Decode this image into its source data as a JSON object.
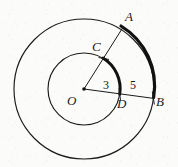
{
  "figure": {
    "background_color": "#fbfbfa",
    "stroke_color": "#1a1a1a",
    "center": {
      "label": "O",
      "x": 84,
      "y": 89
    },
    "circles": [
      {
        "name": "outer-circle",
        "radius": 70,
        "thin_stroke": 1.1
      },
      {
        "name": "inner-circle",
        "radius": 36,
        "thin_stroke": 1.1
      }
    ],
    "points": {
      "A": {
        "label": "A",
        "x": 123,
        "y": 27,
        "on": "outer-circle"
      },
      "B": {
        "label": "B",
        "x": 153,
        "y": 98,
        "on": "outer-circle"
      },
      "C": {
        "label": "C",
        "x": 104,
        "y": 57,
        "on": "inner-circle"
      },
      "D": {
        "label": "D",
        "x": 120,
        "y": 94,
        "on": "inner-circle"
      },
      "O": {
        "label": "O",
        "x": 84,
        "y": 89,
        "on": "center"
      }
    },
    "radii_segments": [
      {
        "name": "segment-OA",
        "from": "O",
        "to": "A",
        "measure_label": "3",
        "through": "C"
      },
      {
        "name": "segment-OB",
        "from": "O",
        "to": "B",
        "measure_label": "5",
        "through": "D"
      }
    ],
    "measure_labels": [
      {
        "name": "radius-inner-measure",
        "text": "3",
        "x": 103,
        "y": 79
      },
      {
        "name": "radius-outer-measure",
        "text": "5",
        "x": 130,
        "y": 79
      }
    ],
    "bold_arcs": [
      {
        "name": "arc-AB",
        "from": "A",
        "to": "B",
        "radius": 70,
        "stroke": 3.1
      },
      {
        "name": "arc-CD",
        "from": "C",
        "to": "D",
        "radius": 36,
        "stroke": 3.0
      }
    ],
    "labels": {
      "A": "A",
      "B": "B",
      "C": "C",
      "D": "D",
      "O": "O",
      "inner_radius_value": "3",
      "outer_radius_value": "5"
    }
  }
}
